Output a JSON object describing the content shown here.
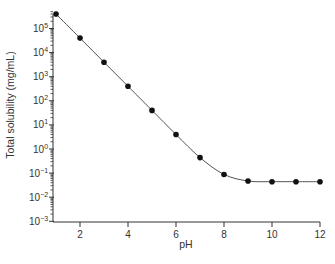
{
  "chart_data": {
    "type": "line",
    "title": "",
    "xlabel": "pH",
    "ylabel": "Total solubility (mg/mL)",
    "yscale": "log",
    "xlim": [
      1,
      12
    ],
    "ylim": [
      0.001,
      100000
    ],
    "x_ticks": [
      2,
      4,
      6,
      8,
      10,
      12
    ],
    "y_ticks": [
      {
        "exp": 5,
        "base": "10",
        "sup": "5"
      },
      {
        "exp": 4,
        "base": "10",
        "sup": "4"
      },
      {
        "exp": 3,
        "base": "10",
        "sup": "3"
      },
      {
        "exp": 2,
        "base": "10",
        "sup": "2"
      },
      {
        "exp": 1,
        "base": "10",
        "sup": "1"
      },
      {
        "exp": 0,
        "base": "10",
        "sup": "0"
      },
      {
        "exp": -1,
        "base": "10",
        "sup": "−1"
      },
      {
        "exp": -2,
        "base": "10",
        "sup": "−2"
      },
      {
        "exp": -3,
        "base": "10",
        "sup": "−3"
      }
    ],
    "grid": false,
    "legend": null,
    "series": [
      {
        "name": "Total solubility",
        "marker": "filled-circle",
        "line": "smooth",
        "x": [
          1,
          2,
          3,
          4,
          5,
          6,
          7,
          8,
          9,
          10,
          11,
          12
        ],
        "values": [
          400000,
          40000,
          4000,
          400,
          40,
          4,
          0.44,
          0.088,
          0.047,
          0.044,
          0.044,
          0.044
        ]
      }
    ],
    "colors": {
      "line": "#555555",
      "marker": "#111111",
      "axis": "#333333"
    }
  }
}
